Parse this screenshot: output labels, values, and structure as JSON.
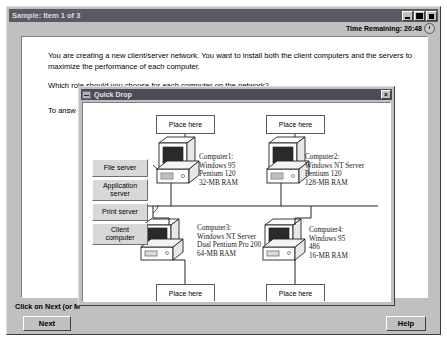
{
  "app": {
    "title": "Sample: Item 1 of 3",
    "time_label": "Time Remaining:",
    "time_value": "20:48",
    "time_remaining_full": "Time Remaining:  20:48",
    "window_buttons": {
      "minimize": "_",
      "maximize": "□",
      "close": "×"
    }
  },
  "question": {
    "paragraph1": "You are creating a new client/server network. You want to install both the client computers and the servers to maximize the performance of each computer.",
    "paragraph2": "Which role should you choose for each computer on the network?",
    "paragraph3": "To answ"
  },
  "status": {
    "text": "Click on Next (or M"
  },
  "buttons": {
    "next": "Next",
    "help": "Help"
  },
  "quickdrop": {
    "title": "Quick Drop",
    "close_label": "×",
    "options": [
      {
        "id": "file-server",
        "label": "File server"
      },
      {
        "id": "application-server",
        "label": "Application\nserver"
      },
      {
        "id": "print-server",
        "label": "Print server"
      },
      {
        "id": "client-computer",
        "label": "Client\ncomputer"
      }
    ],
    "drop_targets": [
      {
        "id": "drop-1",
        "label": "Place here"
      },
      {
        "id": "drop-2",
        "label": "Place here"
      },
      {
        "id": "drop-3",
        "label": "Place here"
      },
      {
        "id": "drop-4",
        "label": "Place here"
      }
    ],
    "computers": [
      {
        "id": "computer1",
        "name": "Computer1:",
        "os": "Windows 95",
        "cpu": "Pentium 120",
        "ram": "32-MB RAM"
      },
      {
        "id": "computer2",
        "name": "Computer2:",
        "os": "Windows NT Server",
        "cpu": "Pentium 120",
        "ram": "128-MB RAM"
      },
      {
        "id": "computer3",
        "name": "Computer3:",
        "os": "Windows NT Server",
        "cpu": "Dual Pentium Pro 200",
        "ram": "64-MB RAM"
      },
      {
        "id": "computer4",
        "name": "Computer4:",
        "os": "Windows 95",
        "cpu": "486",
        "ram": "16-MB RAM"
      }
    ]
  },
  "colors": {
    "window_face": "#c0c0c0",
    "titlebar": "#5a5a66",
    "titlebar_text": "#dcdcdc",
    "client_white": "#ffffff",
    "button_face": "#d8d8d8",
    "text": "#000000"
  }
}
